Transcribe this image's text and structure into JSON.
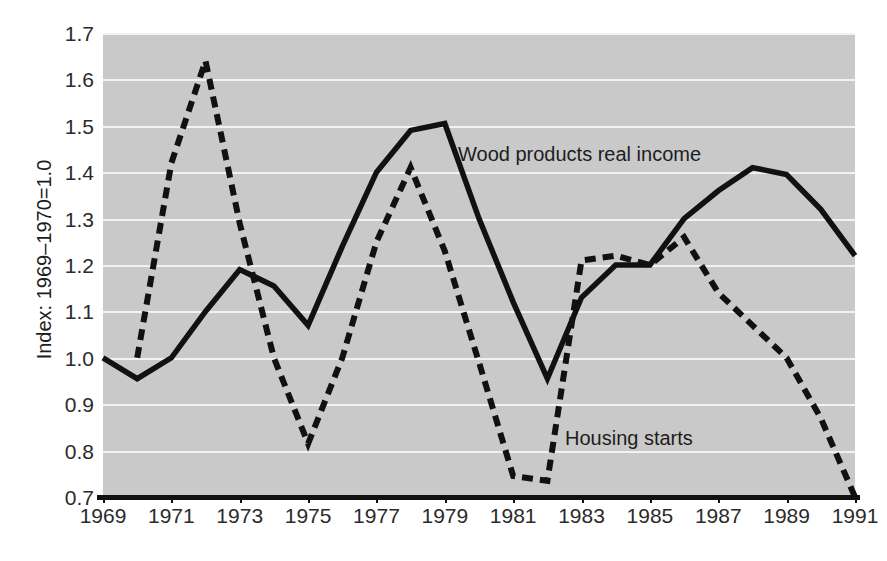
{
  "chart_data": {
    "type": "line",
    "title": "",
    "xlabel": "",
    "ylabel": "Index: 1969–1970=1.0",
    "xlim": [
      1969,
      1991
    ],
    "ylim": [
      0.7,
      1.7
    ],
    "grid": true,
    "legend_position": "inline-annotations",
    "x": [
      1969,
      1970,
      1971,
      1972,
      1973,
      1974,
      1975,
      1976,
      1977,
      1978,
      1979,
      1980,
      1981,
      1982,
      1983,
      1984,
      1985,
      1986,
      1987,
      1988,
      1989,
      1990,
      1991
    ],
    "x_tick_labels": [
      "1969",
      "1971",
      "1973",
      "1975",
      "1977",
      "1979",
      "1981",
      "1983",
      "1985",
      "1987",
      "1989",
      "1991"
    ],
    "x_tick_values": [
      1969,
      1971,
      1973,
      1975,
      1977,
      1979,
      1981,
      1983,
      1985,
      1987,
      1989,
      1991
    ],
    "y_tick_labels": [
      "1.7",
      "1.6",
      "1.5",
      "1.4",
      "1.3",
      "1.2",
      "1.1",
      "1.0",
      "0.9",
      "0.8",
      "0.7"
    ],
    "y_tick_values": [
      1.7,
      1.6,
      1.5,
      1.4,
      1.3,
      1.2,
      1.1,
      1.0,
      0.9,
      0.8,
      0.7
    ],
    "series": [
      {
        "name": "Wood products real income",
        "style": "solid",
        "color": "#111111",
        "x": [
          1969,
          1970,
          1971,
          1972,
          1973,
          1974,
          1975,
          1976,
          1977,
          1978,
          1979,
          1980,
          1981,
          1982,
          1983,
          1984,
          1985,
          1986,
          1987,
          1988,
          1989,
          1990,
          1991
        ],
        "values": [
          1.0,
          0.955,
          1.0,
          1.1,
          1.19,
          1.155,
          1.07,
          1.24,
          1.4,
          1.49,
          1.505,
          1.3,
          1.12,
          0.955,
          1.13,
          1.2,
          1.2,
          1.3,
          1.36,
          1.41,
          1.395,
          1.32,
          1.22
        ]
      },
      {
        "name": "Housing starts",
        "style": "dashed",
        "color": "#111111",
        "x": [
          1970,
          1971,
          1972,
          1973,
          1974,
          1975,
          1976,
          1977,
          1978,
          1979,
          1980,
          1981,
          1982,
          1983,
          1984,
          1985,
          1986,
          1987,
          1988,
          1989,
          1990,
          1991
        ],
        "values": [
          1.0,
          1.42,
          1.64,
          1.29,
          1.0,
          0.815,
          1.0,
          1.25,
          1.41,
          1.23,
          0.99,
          0.745,
          0.735,
          1.21,
          1.22,
          1.2,
          1.26,
          1.14,
          1.07,
          1.0,
          0.87,
          0.7
        ]
      }
    ],
    "annotations": [
      {
        "text": "Wood products real income",
        "x": 1979.6,
        "y": 1.465
      },
      {
        "text": "Housing starts",
        "x": 1982.8,
        "y": 0.855
      }
    ]
  },
  "colors": {
    "plot_background": "#c9c9c9",
    "gridline": "#f2f2f2",
    "axis": "#111111",
    "line": "#111111",
    "text": "#2b2b2b"
  }
}
